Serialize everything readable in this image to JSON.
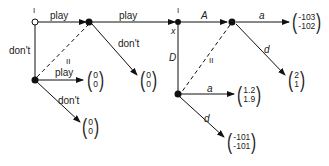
{
  "diagram": {
    "type": "game-tree",
    "nodes": [
      {
        "id": "n1",
        "player": "I",
        "style": "hollow"
      },
      {
        "id": "n2",
        "style": "filled"
      },
      {
        "id": "n3",
        "style": "filled"
      },
      {
        "id": "n4",
        "player": "I",
        "sublabel": "x",
        "style": "filled"
      },
      {
        "id": "n5",
        "style": "filled"
      },
      {
        "id": "n6",
        "style": "filled"
      }
    ],
    "labels": {
      "n1_player": "I",
      "n4_player": "I",
      "n4_x": "x",
      "e_n1_n2": "play",
      "e_n1_n3": "don't",
      "e_n2_n4": "play",
      "e_n2_term": "don't",
      "e_n3_term1": "play",
      "e_n3_term2": "don't",
      "e_n4_n5": "A",
      "e_n4_n6": "D",
      "e_n5_term": "a",
      "e_n5_term2": "d",
      "e_n6_term": "a",
      "e_n6_term2": "d",
      "info_set_1": "II",
      "info_set_2": "II"
    },
    "payoffs": [
      {
        "id": "p_n2_dont",
        "top": "0",
        "bottom": "0"
      },
      {
        "id": "p_n3_play",
        "top": "0",
        "bottom": "0"
      },
      {
        "id": "p_n3_dont",
        "top": "0",
        "bottom": "0"
      },
      {
        "id": "p_n5_a",
        "top": "-103",
        "bottom": "-102"
      },
      {
        "id": "p_n5_d",
        "top": "2",
        "bottom": "1"
      },
      {
        "id": "p_n6_a",
        "top": "1.2",
        "bottom": "1.9"
      },
      {
        "id": "p_n6_d",
        "top": "-101",
        "bottom": "-101"
      }
    ]
  }
}
